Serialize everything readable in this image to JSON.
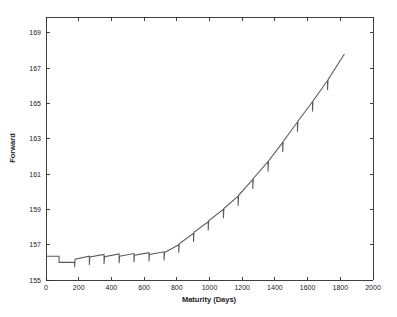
{
  "chart_data": {
    "type": "line",
    "title": "",
    "xlabel": "Maturity (Days)",
    "ylabel": "Forward",
    "xlim": [
      0,
      2000
    ],
    "ylim": [
      155,
      169.9
    ],
    "grid": false,
    "legend": null,
    "line_color": "#595959",
    "axis_color": "#2b2b2b",
    "background_color": "#ffffff",
    "xticks": [
      0,
      200,
      400,
      600,
      800,
      1000,
      1200,
      1400,
      1600,
      1800,
      2000
    ],
    "xtick_labels": [
      "0",
      "200",
      "400",
      "600",
      "800",
      "1000",
      "1200",
      "1400",
      "1600",
      "1800",
      "2000"
    ],
    "yticks": [
      155,
      157,
      159,
      161,
      163,
      165,
      167,
      169
    ],
    "ytick_labels": [
      "155",
      "157",
      "159",
      "161",
      "163",
      "165",
      "167",
      "169"
    ],
    "series": [
      {
        "name": "Forward",
        "x": [
          0,
          80,
          80,
          175,
          175,
          178,
          265,
          265,
          268,
          355,
          355,
          358,
          447,
          447,
          450,
          538,
          538,
          541,
          630,
          630,
          633,
          722,
          722,
          725,
          812,
          812,
          815,
          902,
          902,
          905,
          992,
          992,
          995,
          1085,
          1085,
          1088,
          1175,
          1175,
          1178,
          1265,
          1265,
          1268,
          1358,
          1358,
          1361,
          1448,
          1448,
          1451,
          1538,
          1538,
          1541,
          1630,
          1630,
          1633,
          1722,
          1722,
          1725,
          1825
        ],
        "y": [
          156.35,
          156.35,
          156.0,
          156.0,
          155.72,
          156.18,
          156.35,
          155.85,
          156.3,
          156.45,
          155.9,
          156.32,
          156.48,
          155.95,
          156.35,
          156.5,
          156.0,
          156.4,
          156.55,
          156.05,
          156.45,
          156.6,
          156.1,
          156.55,
          157.0,
          156.55,
          157.05,
          157.65,
          157.15,
          157.7,
          158.3,
          157.8,
          158.35,
          159.0,
          158.5,
          159.05,
          159.75,
          159.2,
          159.8,
          160.7,
          160.15,
          160.75,
          161.7,
          161.15,
          161.75,
          162.8,
          162.25,
          162.85,
          163.95,
          163.4,
          164.0,
          165.1,
          164.55,
          165.15,
          166.3,
          165.75,
          166.35,
          167.8
        ]
      }
    ]
  },
  "plot_geometry": {
    "left": 46,
    "right": 373,
    "top": 17,
    "bottom": 280
  }
}
